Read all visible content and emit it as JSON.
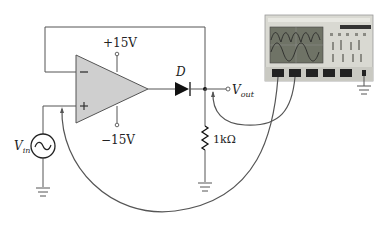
{
  "diagram": {
    "type": "precision-half-wave-rectifier-circuit",
    "components": {
      "op_amp": {
        "supply_positive": "+15V",
        "supply_negative": "−15V",
        "inverting_symbol": "−",
        "noninverting_symbol": "+"
      },
      "diode": {
        "label": "D"
      },
      "resistor": {
        "value": "1kΩ"
      },
      "source": {
        "label_main": "V",
        "label_sub": "in",
        "symbol": "sine-wave"
      },
      "output": {
        "label_main": "V",
        "label_sub": "out"
      },
      "oscilloscope": {
        "channels_connected": 2
      }
    },
    "colors": {
      "wire": "#555555",
      "opamp_fill": "#cfcfcf",
      "probe_cable": "#555555",
      "scope_body": "#d9d9d2",
      "scope_screen": "#6f7366"
    }
  }
}
